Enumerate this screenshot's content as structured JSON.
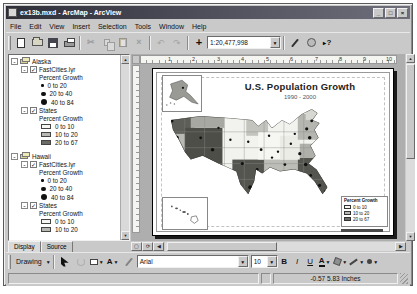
{
  "window": {
    "title": "ex13b.mxd - ArcMap - ArcView"
  },
  "menu": {
    "items": [
      "File",
      "Edit",
      "View",
      "Insert",
      "Selection",
      "Tools",
      "Window",
      "Help"
    ]
  },
  "toolbar": {
    "scale": "1:20,477,998"
  },
  "toc": {
    "tabs": {
      "display": "Display",
      "source": "Source"
    },
    "groups": [
      {
        "name": "Alaska",
        "layers": [
          {
            "name": "FastCities.lyr",
            "heading": "Percent Growth",
            "classes": [
              {
                "label": "0 to 20"
              },
              {
                "label": "20 to 40"
              },
              {
                "label": "40 to 84"
              }
            ]
          },
          {
            "name": "States",
            "heading": "Percent Growth",
            "classes": [
              {
                "label": "0 to 10"
              },
              {
                "label": "10 to 20"
              },
              {
                "label": "20 to 67"
              }
            ]
          }
        ]
      },
      {
        "name": "Hawaii",
        "layers": [
          {
            "name": "FastCities.lyr",
            "heading": "Percent Growth",
            "classes": [
              {
                "label": "0 to 20"
              },
              {
                "label": "20 to 40"
              },
              {
                "label": "40 to 84"
              }
            ]
          },
          {
            "name": "States",
            "heading": "Percent Growth",
            "classes": [
              {
                "label": "0 to 10"
              },
              {
                "label": "10 to 20"
              }
            ]
          }
        ]
      }
    ]
  },
  "layout_view": {
    "ruler": {
      "ticks": [
        "1",
        "2",
        "3",
        "4",
        "5",
        "6",
        "7",
        "8",
        "9",
        "10"
      ]
    },
    "page": {
      "title": "U.S. Population Growth",
      "subtitle": "1990 - 2000",
      "legend": {
        "title": "Percent Growth",
        "classes": [
          {
            "label": "0 to 10"
          },
          {
            "label": "10 to 20"
          },
          {
            "label": "20 to 67"
          }
        ]
      }
    }
  },
  "drawing": {
    "label": "Drawing",
    "font": "Arial",
    "size": "10",
    "bold": "B",
    "italic": "I",
    "underline": "U"
  },
  "status": {
    "coords": "-0.57  5.83 Inches"
  },
  "colors": {
    "class_light": "#f6f6f2",
    "class_mid": "#b9b9b3",
    "class_dark": "#6b6b66",
    "city_dot": "#111111"
  }
}
